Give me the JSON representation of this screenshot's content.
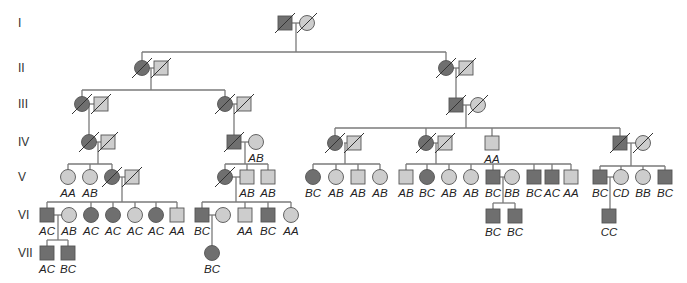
{
  "colors": {
    "affected": "#6f6f6f",
    "unaffected": "#cdcdcd",
    "line": "#7a7a7a"
  },
  "generations": [
    {
      "label": "I",
      "y": 23
    },
    {
      "label": "II",
      "y": 68
    },
    {
      "label": "III",
      "y": 104
    },
    {
      "label": "IV",
      "y": 142
    },
    {
      "label": "V",
      "y": 177
    },
    {
      "label": "VI",
      "y": 215
    },
    {
      "label": "VII",
      "y": 253
    }
  ],
  "individuals": [
    {
      "id": "I1",
      "sex": "M",
      "affected": true,
      "deceased": true,
      "x": 285,
      "y": 23,
      "genotype": ""
    },
    {
      "id": "I2",
      "sex": "F",
      "affected": false,
      "deceased": true,
      "x": 307,
      "y": 23,
      "genotype": ""
    },
    {
      "id": "II1",
      "sex": "F",
      "affected": true,
      "deceased": true,
      "x": 142,
      "y": 68,
      "genotype": ""
    },
    {
      "id": "II2",
      "sex": "M",
      "affected": false,
      "deceased": true,
      "x": 161,
      "y": 68,
      "genotype": ""
    },
    {
      "id": "II3",
      "sex": "F",
      "affected": true,
      "deceased": true,
      "x": 446,
      "y": 68,
      "genotype": ""
    },
    {
      "id": "II4",
      "sex": "M",
      "affected": false,
      "deceased": true,
      "x": 466,
      "y": 68,
      "genotype": ""
    },
    {
      "id": "III1",
      "sex": "F",
      "affected": true,
      "deceased": true,
      "x": 82,
      "y": 104,
      "genotype": ""
    },
    {
      "id": "III2",
      "sex": "M",
      "affected": false,
      "deceased": true,
      "x": 101,
      "y": 104,
      "genotype": ""
    },
    {
      "id": "III3",
      "sex": "F",
      "affected": true,
      "deceased": true,
      "x": 225,
      "y": 104,
      "genotype": ""
    },
    {
      "id": "III4",
      "sex": "M",
      "affected": false,
      "deceased": true,
      "x": 244,
      "y": 104,
      "genotype": ""
    },
    {
      "id": "III5",
      "sex": "M",
      "affected": true,
      "deceased": true,
      "x": 456,
      "y": 105,
      "genotype": ""
    },
    {
      "id": "III6",
      "sex": "F",
      "affected": false,
      "deceased": true,
      "x": 478,
      "y": 105,
      "genotype": ""
    },
    {
      "id": "IV1",
      "sex": "F",
      "affected": true,
      "deceased": true,
      "x": 89,
      "y": 142,
      "genotype": ""
    },
    {
      "id": "IV2",
      "sex": "M",
      "affected": false,
      "deceased": true,
      "x": 108,
      "y": 142,
      "genotype": ""
    },
    {
      "id": "IV3",
      "sex": "M",
      "affected": true,
      "deceased": true,
      "x": 234,
      "y": 142,
      "genotype": ""
    },
    {
      "id": "IV4",
      "sex": "F",
      "affected": false,
      "deceased": false,
      "x": 256,
      "y": 142,
      "genotype": "AB"
    },
    {
      "id": "IV5",
      "sex": "F",
      "affected": true,
      "deceased": true,
      "x": 335,
      "y": 143,
      "genotype": ""
    },
    {
      "id": "IV6",
      "sex": "M",
      "affected": false,
      "deceased": true,
      "x": 354,
      "y": 143,
      "genotype": ""
    },
    {
      "id": "IV7",
      "sex": "F",
      "affected": true,
      "deceased": true,
      "x": 426,
      "y": 143,
      "genotype": ""
    },
    {
      "id": "IV8",
      "sex": "M",
      "affected": false,
      "deceased": true,
      "x": 445,
      "y": 143,
      "genotype": ""
    },
    {
      "id": "IV9",
      "sex": "M",
      "affected": false,
      "deceased": false,
      "x": 492,
      "y": 143,
      "genotype": "AA"
    },
    {
      "id": "IV10",
      "sex": "M",
      "affected": true,
      "deceased": true,
      "x": 620,
      "y": 143,
      "genotype": ""
    },
    {
      "id": "IV11",
      "sex": "F",
      "affected": false,
      "deceased": true,
      "x": 643,
      "y": 143,
      "genotype": ""
    },
    {
      "id": "V1",
      "sex": "F",
      "affected": false,
      "deceased": false,
      "x": 68,
      "y": 177,
      "genotype": "AA"
    },
    {
      "id": "V2",
      "sex": "F",
      "affected": false,
      "deceased": false,
      "x": 90,
      "y": 177,
      "genotype": "AB"
    },
    {
      "id": "V3",
      "sex": "F",
      "affected": true,
      "deceased": true,
      "x": 112,
      "y": 177,
      "genotype": ""
    },
    {
      "id": "V4",
      "sex": "M",
      "affected": false,
      "deceased": true,
      "x": 132,
      "y": 177,
      "genotype": ""
    },
    {
      "id": "V5",
      "sex": "F",
      "affected": true,
      "deceased": true,
      "x": 225,
      "y": 177,
      "genotype": ""
    },
    {
      "id": "V6",
      "sex": "M",
      "affected": false,
      "deceased": false,
      "x": 247,
      "y": 177,
      "genotype": "AB"
    },
    {
      "id": "V7",
      "sex": "M",
      "affected": false,
      "deceased": false,
      "x": 268,
      "y": 177,
      "genotype": "AB"
    },
    {
      "id": "V8",
      "sex": "F",
      "affected": true,
      "deceased": false,
      "x": 313,
      "y": 177,
      "genotype": "BC"
    },
    {
      "id": "V9",
      "sex": "F",
      "affected": false,
      "deceased": false,
      "x": 336,
      "y": 177,
      "genotype": "AB"
    },
    {
      "id": "V10",
      "sex": "M",
      "affected": false,
      "deceased": false,
      "x": 358,
      "y": 177,
      "genotype": "AB"
    },
    {
      "id": "V11",
      "sex": "F",
      "affected": false,
      "deceased": false,
      "x": 380,
      "y": 177,
      "genotype": "AB"
    },
    {
      "id": "V12",
      "sex": "M",
      "affected": false,
      "deceased": false,
      "x": 406,
      "y": 177,
      "genotype": "AB"
    },
    {
      "id": "V13",
      "sex": "F",
      "affected": true,
      "deceased": false,
      "x": 427,
      "y": 177,
      "genotype": "BC"
    },
    {
      "id": "V14",
      "sex": "F",
      "affected": false,
      "deceased": false,
      "x": 449,
      "y": 177,
      "genotype": "AB"
    },
    {
      "id": "V15",
      "sex": "F",
      "affected": false,
      "deceased": false,
      "x": 471,
      "y": 177,
      "genotype": "AB"
    },
    {
      "id": "V16",
      "sex": "M",
      "affected": true,
      "deceased": false,
      "x": 493,
      "y": 177,
      "genotype": "BC"
    },
    {
      "id": "V17",
      "sex": "F",
      "affected": false,
      "deceased": false,
      "x": 512,
      "y": 177,
      "genotype": "BB"
    },
    {
      "id": "V18",
      "sex": "M",
      "affected": true,
      "deceased": false,
      "x": 534,
      "y": 177,
      "genotype": "BC"
    },
    {
      "id": "V19",
      "sex": "M",
      "affected": true,
      "deceased": false,
      "x": 552,
      "y": 177,
      "genotype": "AC"
    },
    {
      "id": "V20",
      "sex": "M",
      "affected": false,
      "deceased": false,
      "x": 571,
      "y": 177,
      "genotype": "AA"
    },
    {
      "id": "V21",
      "sex": "M",
      "affected": true,
      "deceased": false,
      "x": 600,
      "y": 177,
      "genotype": "BC"
    },
    {
      "id": "V22",
      "sex": "F",
      "affected": false,
      "deceased": false,
      "x": 621,
      "y": 177,
      "genotype": "CD"
    },
    {
      "id": "V23",
      "sex": "F",
      "affected": false,
      "deceased": false,
      "x": 643,
      "y": 177,
      "genotype": "BB"
    },
    {
      "id": "V24",
      "sex": "M",
      "affected": true,
      "deceased": false,
      "x": 665,
      "y": 177,
      "genotype": "BC"
    },
    {
      "id": "VI1",
      "sex": "M",
      "affected": true,
      "deceased": false,
      "x": 47,
      "y": 215,
      "genotype": "AC"
    },
    {
      "id": "VI2",
      "sex": "F",
      "affected": false,
      "deceased": false,
      "x": 69,
      "y": 215,
      "genotype": "AB"
    },
    {
      "id": "VI3",
      "sex": "F",
      "affected": true,
      "deceased": false,
      "x": 91,
      "y": 215,
      "genotype": "AC"
    },
    {
      "id": "VI4",
      "sex": "F",
      "affected": true,
      "deceased": false,
      "x": 113,
      "y": 215,
      "genotype": "AC"
    },
    {
      "id": "VI5",
      "sex": "F",
      "affected": false,
      "deceased": false,
      "x": 135,
      "y": 215,
      "genotype": "AC"
    },
    {
      "id": "VI6",
      "sex": "F",
      "affected": true,
      "deceased": false,
      "x": 156,
      "y": 215,
      "genotype": "AC"
    },
    {
      "id": "VI7",
      "sex": "M",
      "affected": false,
      "deceased": false,
      "x": 177,
      "y": 215,
      "genotype": "AA"
    },
    {
      "id": "VI8",
      "sex": "M",
      "affected": true,
      "deceased": false,
      "x": 202,
      "y": 215,
      "genotype": "BC"
    },
    {
      "id": "VI9",
      "sex": "F",
      "affected": false,
      "deceased": false,
      "x": 223,
      "y": 215,
      "genotype": ""
    },
    {
      "id": "VI10",
      "sex": "M",
      "affected": false,
      "deceased": false,
      "x": 245,
      "y": 215,
      "genotype": "AA"
    },
    {
      "id": "VI11",
      "sex": "M",
      "affected": true,
      "deceased": false,
      "x": 268,
      "y": 215,
      "genotype": "BC"
    },
    {
      "id": "VI12",
      "sex": "F",
      "affected": false,
      "deceased": false,
      "x": 291,
      "y": 215,
      "genotype": "AA"
    },
    {
      "id": "VI13",
      "sex": "M",
      "affected": true,
      "deceased": false,
      "x": 493,
      "y": 216,
      "genotype": "BC"
    },
    {
      "id": "VI14",
      "sex": "M",
      "affected": true,
      "deceased": false,
      "x": 515,
      "y": 216,
      "genotype": "BC"
    },
    {
      "id": "VI15",
      "sex": "M",
      "affected": true,
      "deceased": false,
      "x": 609,
      "y": 216,
      "genotype": "CC"
    },
    {
      "id": "VII1",
      "sex": "M",
      "affected": true,
      "deceased": false,
      "x": 47,
      "y": 253,
      "genotype": "AC"
    },
    {
      "id": "VII2",
      "sex": "M",
      "affected": true,
      "deceased": false,
      "x": 68,
      "y": 253,
      "genotype": "BC"
    },
    {
      "id": "VII3",
      "sex": "F",
      "affected": true,
      "deceased": false,
      "x": 212,
      "y": 253,
      "genotype": "BC"
    }
  ],
  "lines": [
    [
      291,
      23,
      301,
      23
    ],
    [
      296,
      23,
      296,
      52
    ],
    [
      142,
      52,
      446,
      52
    ],
    [
      142,
      52,
      142,
      61
    ],
    [
      446,
      52,
      446,
      61
    ],
    [
      149,
      68,
      154,
      68
    ],
    [
      151,
      68,
      151,
      90
    ],
    [
      82,
      90,
      225,
      90
    ],
    [
      82,
      90,
      82,
      97
    ],
    [
      225,
      90,
      225,
      97
    ],
    [
      453,
      68,
      459,
      68
    ],
    [
      456,
      68,
      456,
      98
    ],
    [
      89,
      104,
      94,
      104
    ],
    [
      89,
      104,
      89,
      135
    ],
    [
      232,
      104,
      237,
      104
    ],
    [
      234,
      104,
      234,
      135
    ],
    [
      462,
      105,
      471,
      105
    ],
    [
      466,
      105,
      466,
      128
    ],
    [
      335,
      128,
      620,
      128
    ],
    [
      335,
      128,
      335,
      136
    ],
    [
      426,
      128,
      426,
      136
    ],
    [
      492,
      128,
      492,
      136
    ],
    [
      620,
      128,
      620,
      136
    ],
    [
      96,
      142,
      101,
      142
    ],
    [
      98,
      142,
      98,
      164
    ],
    [
      68,
      164,
      112,
      164
    ],
    [
      68,
      164,
      68,
      170
    ],
    [
      90,
      164,
      90,
      170
    ],
    [
      112,
      164,
      112,
      170
    ],
    [
      241,
      142,
      249,
      142
    ],
    [
      245,
      142,
      245,
      164
    ],
    [
      225,
      164,
      268,
      164
    ],
    [
      225,
      164,
      225,
      170
    ],
    [
      247,
      164,
      247,
      170
    ],
    [
      268,
      164,
      268,
      170
    ],
    [
      344,
      143,
      347,
      143
    ],
    [
      345,
      143,
      345,
      164
    ],
    [
      313,
      164,
      380,
      164
    ],
    [
      313,
      164,
      313,
      170
    ],
    [
      336,
      164,
      336,
      170
    ],
    [
      358,
      164,
      358,
      170
    ],
    [
      380,
      164,
      380,
      170
    ],
    [
      433,
      143,
      438,
      143
    ],
    [
      436,
      143,
      436,
      164
    ],
    [
      406,
      164,
      571,
      164
    ],
    [
      406,
      164,
      406,
      170
    ],
    [
      427,
      164,
      427,
      170
    ],
    [
      449,
      164,
      449,
      170
    ],
    [
      471,
      164,
      471,
      170
    ],
    [
      493,
      164,
      493,
      170
    ],
    [
      534,
      164,
      534,
      170
    ],
    [
      552,
      164,
      552,
      170
    ],
    [
      571,
      164,
      571,
      170
    ],
    [
      627,
      143,
      636,
      143
    ],
    [
      631,
      143,
      631,
      166
    ],
    [
      600,
      166,
      665,
      166
    ],
    [
      600,
      166,
      600,
      170
    ],
    [
      621,
      166,
      621,
      170
    ],
    [
      643,
      166,
      643,
      170
    ],
    [
      665,
      166,
      665,
      170
    ],
    [
      119,
      177,
      125,
      177
    ],
    [
      122,
      177,
      122,
      202
    ],
    [
      47,
      202,
      177,
      202
    ],
    [
      47,
      202,
      47,
      208
    ],
    [
      91,
      202,
      91,
      208
    ],
    [
      113,
      202,
      113,
      208
    ],
    [
      135,
      202,
      135,
      208
    ],
    [
      156,
      202,
      156,
      208
    ],
    [
      177,
      202,
      177,
      208
    ],
    [
      232,
      177,
      240,
      177
    ],
    [
      236,
      177,
      236,
      202
    ],
    [
      202,
      202,
      291,
      202
    ],
    [
      202,
      202,
      202,
      208
    ],
    [
      245,
      202,
      245,
      208
    ],
    [
      268,
      202,
      268,
      208
    ],
    [
      291,
      202,
      291,
      208
    ],
    [
      500,
      177,
      505,
      177
    ],
    [
      503,
      177,
      503,
      203
    ],
    [
      493,
      203,
      515,
      203
    ],
    [
      493,
      203,
      493,
      209
    ],
    [
      515,
      203,
      515,
      209
    ],
    [
      607,
      177,
      614,
      177
    ],
    [
      610,
      177,
      610,
      209
    ],
    [
      54,
      215,
      62,
      215
    ],
    [
      58,
      215,
      58,
      240
    ],
    [
      47,
      240,
      68,
      240
    ],
    [
      47,
      240,
      47,
      246
    ],
    [
      68,
      240,
      68,
      246
    ],
    [
      209,
      215,
      216,
      215
    ],
    [
      212,
      215,
      212,
      246
    ]
  ]
}
